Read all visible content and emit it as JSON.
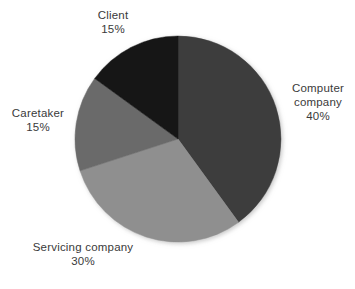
{
  "chart_data": {
    "type": "pie",
    "title": "",
    "subtitle": "",
    "xlabel": "",
    "ylabel": "",
    "grid": false,
    "legend_position": "none",
    "label_format": "name + percent",
    "start_angle_deg": 0,
    "direction": "clockwise",
    "background": "#ffffff",
    "text_color": "#3a3a3a",
    "categories": [
      "Computer company",
      "Servicing company",
      "Caretaker",
      "Client"
    ],
    "values": [
      40,
      30,
      15,
      15
    ],
    "units": "%",
    "total": 100,
    "colors": [
      "#3d3d3d",
      "#8f8f8f",
      "#6b6b6b",
      "#151515"
    ],
    "slices": [
      {
        "name": "Computer company",
        "value": 40,
        "value_text": "40%",
        "color": "#3d3d3d",
        "start_deg": 0,
        "end_deg": 144,
        "label_lines": [
          "Computer",
          "company",
          "40%"
        ],
        "label_position": "right"
      },
      {
        "name": "Servicing company",
        "value": 30,
        "value_text": "30%",
        "color": "#8f8f8f",
        "start_deg": 144,
        "end_deg": 252,
        "label_lines": [
          "Servicing company",
          "30%"
        ],
        "label_position": "bottom"
      },
      {
        "name": "Caretaker",
        "value": 15,
        "value_text": "15%",
        "color": "#6b6b6b",
        "start_deg": 252,
        "end_deg": 306,
        "label_lines": [
          "Caretaker",
          "15%"
        ],
        "label_position": "left"
      },
      {
        "name": "Client",
        "value": 15,
        "value_text": "15%",
        "color": "#151515",
        "start_deg": 306,
        "end_deg": 360,
        "label_lines": [
          "Client",
          "15%"
        ],
        "label_position": "top"
      }
    ]
  },
  "labels": {
    "client": {
      "name": "Client",
      "value": "15%"
    },
    "computer_line1": "Computer",
    "computer_line2": "company",
    "computer_value": "40%",
    "caretaker": {
      "name": "Caretaker",
      "value": "15%"
    },
    "servicing": {
      "name": "Servicing company",
      "value": "30%"
    }
  },
  "geometry": {
    "center_x": 178,
    "center_y": 139,
    "radius": 103
  }
}
